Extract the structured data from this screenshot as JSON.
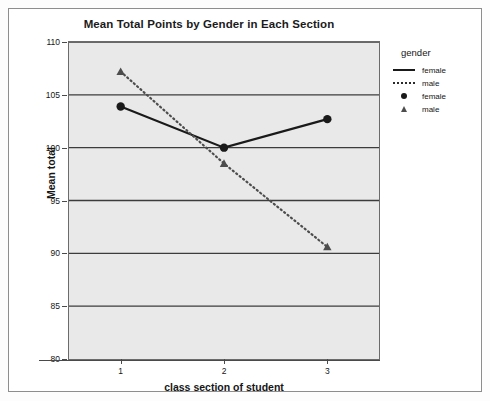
{
  "chart_data": {
    "type": "line",
    "title": "Mean Total Points by Gender in Each Section",
    "xlabel": "class section of student",
    "ylabel": "Mean total",
    "categories": [
      "1",
      "2",
      "3"
    ],
    "x": [
      1,
      2,
      3
    ],
    "ylim": [
      80,
      110
    ],
    "yticks": [
      80,
      85,
      90,
      95,
      100,
      105,
      110
    ],
    "ytick_labels": [
      "80",
      "85",
      "90",
      "95",
      "100",
      "105",
      "110"
    ],
    "grid": "horizontal",
    "legend_position": "right",
    "legend_title": "gender",
    "plot_background": "#e9e9e9",
    "series": [
      {
        "name": "female",
        "values": [
          103.9,
          100.0,
          102.7
        ],
        "line_style": "solid",
        "marker": "circle",
        "color": "#1a1a1a"
      },
      {
        "name": "male",
        "values": [
          107.2,
          98.5,
          90.6
        ],
        "line_style": "dotted",
        "marker": "triangle",
        "color": "#4d4d4d"
      }
    ]
  },
  "legend": {
    "title": "gender",
    "entries": [
      {
        "label": "female",
        "key": "solid-line"
      },
      {
        "label": "male",
        "key": "dotted-line"
      },
      {
        "label": "female",
        "key": "circle-marker"
      },
      {
        "label": "male",
        "key": "triangle-marker"
      }
    ]
  }
}
